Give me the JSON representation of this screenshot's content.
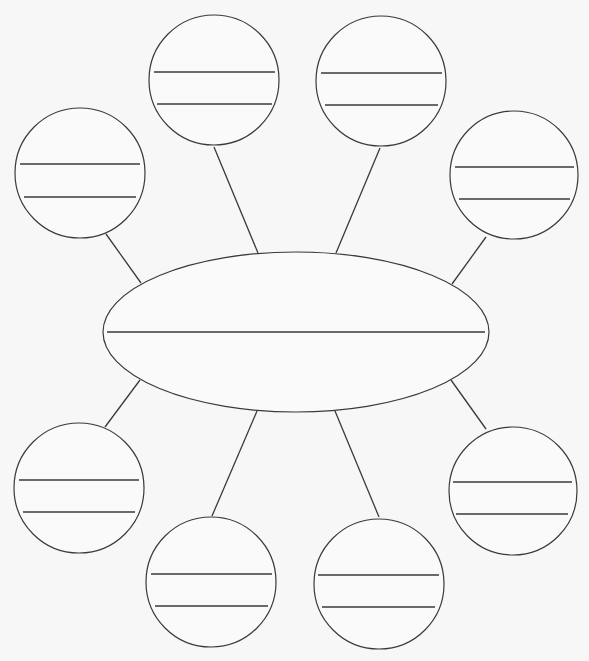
{
  "diagram": {
    "type": "bubble-map",
    "background": "#f7f7f7",
    "stroke_color": "#3a3a3a",
    "center": {
      "cx": 296,
      "cy": 332,
      "rx": 193,
      "ry": 80,
      "lines": [
        {
          "x1": 107,
          "x2": 485,
          "y": 332
        }
      ],
      "text": ""
    },
    "nodes": [
      {
        "id": "top-left",
        "cx": 80,
        "cy": 173,
        "r": 65,
        "lines": [
          {
            "x1": 20,
            "x2": 140,
            "y": 164
          },
          {
            "x1": 24,
            "x2": 136,
            "y": 197
          }
        ],
        "connector": {
          "x1": 106,
          "y1": 234,
          "x2": 141,
          "y2": 283
        },
        "text": ""
      },
      {
        "id": "top-center-left",
        "cx": 214,
        "cy": 80,
        "r": 65,
        "lines": [
          {
            "x1": 154,
            "x2": 275,
            "y": 72
          },
          {
            "x1": 157,
            "x2": 272,
            "y": 104
          }
        ],
        "connector": {
          "x1": 214,
          "y1": 147,
          "x2": 258,
          "y2": 253
        },
        "text": ""
      },
      {
        "id": "top-center-right",
        "cx": 381,
        "cy": 81,
        "r": 65,
        "lines": [
          {
            "x1": 321,
            "x2": 442,
            "y": 73
          },
          {
            "x1": 325,
            "x2": 438,
            "y": 105
          }
        ],
        "connector": {
          "x1": 380,
          "y1": 148,
          "x2": 336,
          "y2": 253
        },
        "text": ""
      },
      {
        "id": "top-right",
        "cx": 514,
        "cy": 175,
        "r": 64,
        "lines": [
          {
            "x1": 455,
            "x2": 574,
            "y": 167
          },
          {
            "x1": 459,
            "x2": 570,
            "y": 199
          }
        ],
        "connector": {
          "x1": 486,
          "y1": 237,
          "x2": 452,
          "y2": 284
        },
        "text": ""
      },
      {
        "id": "bottom-left",
        "cx": 79,
        "cy": 488,
        "r": 65,
        "lines": [
          {
            "x1": 19,
            "x2": 139,
            "y": 480
          },
          {
            "x1": 23,
            "x2": 135,
            "y": 512
          }
        ],
        "connector": {
          "x1": 105,
          "y1": 427,
          "x2": 140,
          "y2": 380
        },
        "text": ""
      },
      {
        "id": "bottom-center-left",
        "cx": 211,
        "cy": 582,
        "r": 65,
        "lines": [
          {
            "x1": 151,
            "x2": 272,
            "y": 574
          },
          {
            "x1": 155,
            "x2": 268,
            "y": 606
          }
        ],
        "connector": {
          "x1": 212,
          "y1": 516,
          "x2": 257,
          "y2": 411
        },
        "text": ""
      },
      {
        "id": "bottom-center-right",
        "cx": 379,
        "cy": 584,
        "r": 65,
        "lines": [
          {
            "x1": 318,
            "x2": 439,
            "y": 575
          },
          {
            "x1": 322,
            "x2": 435,
            "y": 607
          }
        ],
        "connector": {
          "x1": 379,
          "y1": 517,
          "x2": 335,
          "y2": 411
        },
        "text": ""
      },
      {
        "id": "bottom-right",
        "cx": 513,
        "cy": 491,
        "r": 64,
        "lines": [
          {
            "x1": 453,
            "x2": 572,
            "y": 482
          },
          {
            "x1": 456,
            "x2": 568,
            "y": 514
          }
        ],
        "connector": {
          "x1": 486,
          "y1": 429,
          "x2": 451,
          "y2": 380
        },
        "text": ""
      }
    ]
  }
}
